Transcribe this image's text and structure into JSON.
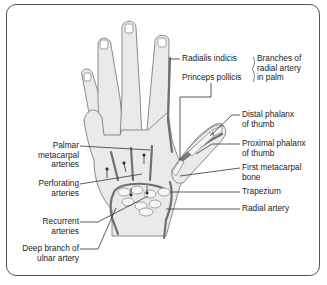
{
  "diagram": {
    "labels_left": [
      {
        "id": "palmar-metacarpal",
        "lines": [
          "Palmar",
          "metacarpal",
          "arteries"
        ]
      },
      {
        "id": "perforating",
        "lines": [
          "Perforating",
          "arteries"
        ]
      },
      {
        "id": "recurrent",
        "lines": [
          "Recurrent",
          "arteries"
        ]
      },
      {
        "id": "deep-branch-ulnar",
        "lines": [
          "Deep branch of",
          "ulnar artery"
        ]
      }
    ],
    "labels_top": [
      {
        "id": "radialis-indicis",
        "lines": [
          "Radialis indicis"
        ]
      },
      {
        "id": "princeps-pollicis",
        "lines": [
          "Princeps pollicis"
        ]
      }
    ],
    "group_label": {
      "id": "branches-radial-palm",
      "lines": [
        "Branches of",
        "radial artery",
        "in palm"
      ]
    },
    "labels_right": [
      {
        "id": "distal-phalanx",
        "lines": [
          "Distal phalanx",
          "of thumb"
        ]
      },
      {
        "id": "proximal-phalanx",
        "lines": [
          "Proximal phalanx",
          "of thumb"
        ]
      },
      {
        "id": "first-metacarpal",
        "lines": [
          "First metacarpal",
          "bone"
        ]
      },
      {
        "id": "trapezium",
        "lines": [
          "Trapezium"
        ]
      },
      {
        "id": "radial-artery",
        "lines": [
          "Radial artery"
        ]
      }
    ],
    "colors": {
      "border": "#555555",
      "hand_fill": "#e8e8e8",
      "hand_outline": "#8a8a8a",
      "artery": "#707070",
      "leader_line": "#333333",
      "text": "#222222"
    }
  }
}
